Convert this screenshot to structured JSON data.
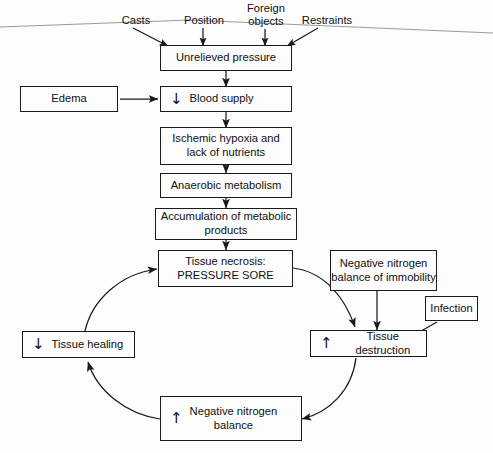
{
  "diagram": {
    "background": "#fdfdfd",
    "line_color": "#1a1a1a",
    "text_color": "#101010"
  },
  "inputs": [
    {
      "id": "casts",
      "label": "Casts"
    },
    {
      "id": "position",
      "label": "Position"
    },
    {
      "id": "foreign-objects",
      "label": "Foreign\nobjects"
    },
    {
      "id": "restraints",
      "label": "Restraints"
    }
  ],
  "nodes": {
    "unrelieved_pressure": {
      "label": "Unrelieved pressure",
      "glyph": ""
    },
    "blood_supply": {
      "label": "Blood supply",
      "glyph": "↓"
    },
    "ischemic_hypoxia": {
      "label": "Ischemic hypoxia  and\nlack of nutrients",
      "glyph": ""
    },
    "anaerobic_metabolism": {
      "label": "Anaerobic metabolism",
      "glyph": ""
    },
    "accumulation": {
      "label": "Accumulation of metabolic\nproducts",
      "glyph": ""
    },
    "tissue_necrosis": {
      "label": "Tissue necrosis:\nPRESSURE SORE",
      "glyph": ""
    },
    "edema": {
      "label": "Edema",
      "glyph": ""
    },
    "negative_nitrogen_immobility": {
      "label": "Negative nitrogen\nbalance of immobility",
      "glyph": ""
    },
    "infection": {
      "label": "Infection",
      "glyph": ""
    },
    "tissue_destruction": {
      "label": "Tissue destruction",
      "glyph": "↑"
    },
    "tissue_healing": {
      "label": "Tissue healing",
      "glyph": "↓"
    },
    "negative_nitrogen_balance": {
      "label": "Negative nitrogen\nbalance",
      "glyph": "↑"
    }
  }
}
